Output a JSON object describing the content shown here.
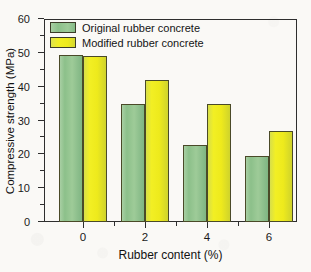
{
  "chart_data": {
    "type": "bar",
    "title": "",
    "xlabel": "Rubber content (%)",
    "ylabel": "Compressive strength (MPa)",
    "categories": [
      "0",
      "2",
      "4",
      "6"
    ],
    "series": [
      {
        "name": "Original rubber concrete",
        "color": "#8cc08a",
        "values": [
          49.4,
          35.0,
          22.8,
          19.4
        ]
      },
      {
        "name": "Modified rubber concrete",
        "color": "#eeea1c",
        "values": [
          49.2,
          42.0,
          34.8,
          27.0
        ]
      }
    ],
    "ylim": [
      0,
      60
    ],
    "yticks": [
      "0",
      "10",
      "20",
      "30",
      "40",
      "50",
      "60"
    ],
    "ytick_values": [
      0,
      10,
      20,
      30,
      40,
      50,
      60
    ],
    "y_minor_step": 5,
    "grid": false,
    "legend_position": "top-left",
    "frame": "box",
    "background_color": "#faf9f6",
    "axis_color": "#2e2e2e"
  },
  "legend": {
    "entries": [
      {
        "label": "Original rubber concrete",
        "swatch": "green-swatch"
      },
      {
        "label": "Modified rubber concrete",
        "swatch": "yellow-swatch"
      }
    ]
  }
}
